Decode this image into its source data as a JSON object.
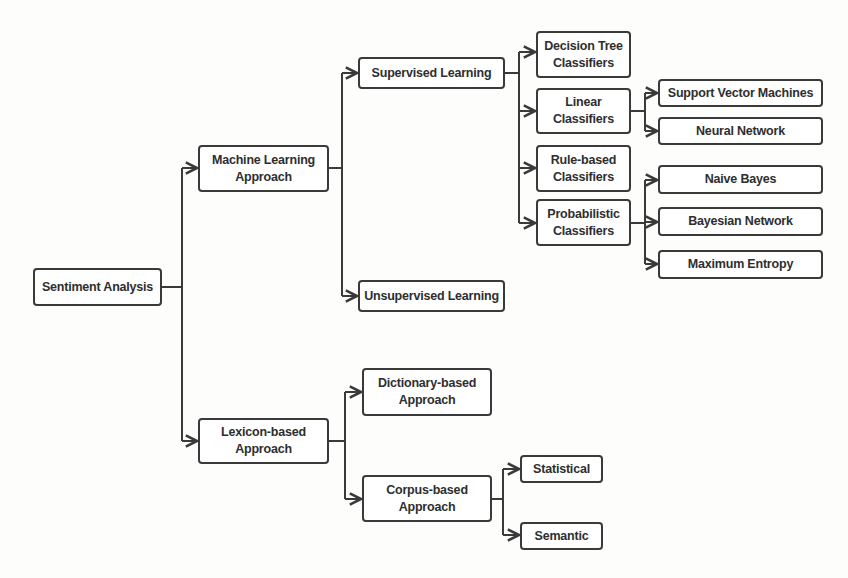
{
  "diagram": {
    "type": "tree",
    "direction": "left-to-right",
    "colors": {
      "line": "#3a3a3a",
      "text": "#2e2e2e",
      "box_fill": "#ffffff",
      "background": "#fdfdfc"
    },
    "root": {
      "label": "Sentiment Analysis",
      "children": [
        {
          "label": "Machine Learning Approach",
          "children": [
            {
              "label": "Supervised Learning",
              "children": [
                {
                  "label": "Decision Tree Classifiers"
                },
                {
                  "label": "Linear Classifiers",
                  "children": [
                    {
                      "label": "Support Vector Machines"
                    },
                    {
                      "label": "Neural Network"
                    }
                  ]
                },
                {
                  "label": "Rule-based Classifiers"
                },
                {
                  "label": "Probabilistic Classifiers",
                  "children": [
                    {
                      "label": "Naive Bayes"
                    },
                    {
                      "label": "Bayesian Network"
                    },
                    {
                      "label": "Maximum Entropy"
                    }
                  ]
                }
              ]
            },
            {
              "label": "Unsupervised Learning"
            }
          ]
        },
        {
          "label": "Lexicon-based Approach",
          "children": [
            {
              "label": "Dictionary-based Approach"
            },
            {
              "label": "Corpus-based Approach",
              "children": [
                {
                  "label": "Statistical"
                },
                {
                  "label": "Semantic"
                }
              ]
            }
          ]
        }
      ]
    }
  },
  "nodes": {
    "sentiment_analysis": "Sentiment Analysis",
    "ml_line1": "Machine Learning",
    "ml_line2": "Approach",
    "lexicon_line1": "Lexicon-based",
    "lexicon_line2": "Approach",
    "supervised": "Supervised Learning",
    "unsupervised": "Unsupervised Learning",
    "decision_tree_line1": "Decision Tree",
    "decision_tree_line2": "Classifiers",
    "linear_line1": "Linear",
    "linear_line2": "Classifiers",
    "rule_line1": "Rule-based",
    "rule_line2": "Classifiers",
    "prob_line1": "Probabilistic",
    "prob_line2": "Classifiers",
    "svm": "Support Vector Machines",
    "neural": "Neural Network",
    "naive_bayes": "Naive Bayes",
    "bayesian": "Bayesian Network",
    "max_entropy": "Maximum Entropy",
    "dictionary_line1": "Dictionary-based",
    "dictionary_line2": "Approach",
    "corpus_line1": "Corpus-based",
    "corpus_line2": "Approach",
    "statistical": "Statistical",
    "semantic": "Semantic"
  }
}
